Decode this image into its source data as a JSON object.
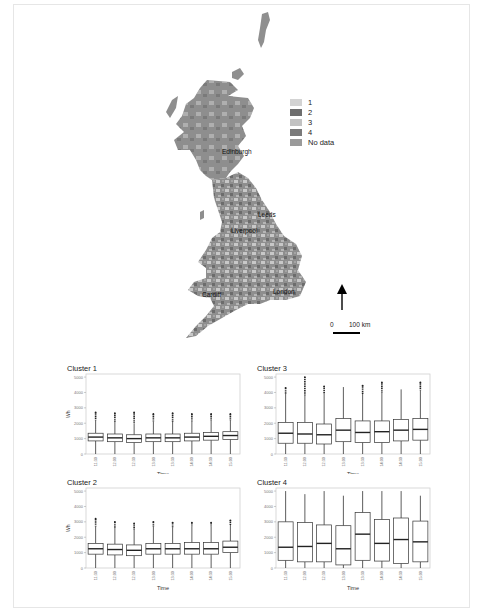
{
  "map": {
    "legend": {
      "items": [
        {
          "label": "1",
          "color": "#d3d3d3"
        },
        {
          "label": "2",
          "color": "#6e6e6e"
        },
        {
          "label": "3",
          "color": "#c2c2c2"
        },
        {
          "label": "4",
          "color": "#7a7a7a"
        },
        {
          "label": "No data",
          "color": "#9a9a9a"
        }
      ]
    },
    "cities": [
      {
        "name": "Edinburgh",
        "x": 222,
        "y": 148
      },
      {
        "name": "Leeds",
        "x": 258,
        "y": 211
      },
      {
        "name": "Liverpool",
        "x": 231,
        "y": 227
      },
      {
        "name": "Cardiff",
        "x": 202,
        "y": 291
      },
      {
        "name": "London",
        "x": 273,
        "y": 288
      }
    ],
    "scale_bar": {
      "zero": "0",
      "distance": "100 km"
    },
    "north_arrow": "north-arrow"
  },
  "chart_data": [
    {
      "type": "box",
      "title": "Cluster 1",
      "xlabel": "Time",
      "ylabel": "Wh",
      "categories": [
        "11:30",
        "12:00",
        "12:30",
        "13:00",
        "13:30",
        "14:00",
        "14:30",
        "15:00"
      ],
      "yticks": [
        0,
        1000,
        2000,
        3000,
        4000,
        5000
      ],
      "ylim": [
        0,
        5200
      ],
      "boxes": [
        {
          "min": 0,
          "q1": 850,
          "median": 1100,
          "q3": 1350,
          "max": 2200,
          "outlier_max": 2700
        },
        {
          "min": 0,
          "q1": 800,
          "median": 1050,
          "q3": 1300,
          "max": 2100,
          "outlier_max": 2650
        },
        {
          "min": 0,
          "q1": 750,
          "median": 1000,
          "q3": 1250,
          "max": 2000,
          "outlier_max": 2700
        },
        {
          "min": 0,
          "q1": 800,
          "median": 1050,
          "q3": 1300,
          "max": 2100,
          "outlier_max": 2600
        },
        {
          "min": 0,
          "q1": 800,
          "median": 1050,
          "q3": 1300,
          "max": 2100,
          "outlier_max": 2650
        },
        {
          "min": 0,
          "q1": 850,
          "median": 1100,
          "q3": 1350,
          "max": 2100,
          "outlier_max": 2600
        },
        {
          "min": 0,
          "q1": 900,
          "median": 1150,
          "q3": 1400,
          "max": 2200,
          "outlier_max": 2600
        },
        {
          "min": 0,
          "q1": 950,
          "median": 1200,
          "q3": 1450,
          "max": 2200,
          "outlier_max": 2600
        }
      ]
    },
    {
      "type": "box",
      "title": "Cluster 3",
      "xlabel": "Time",
      "ylabel": "",
      "categories": [
        "11:30",
        "12:00",
        "12:30",
        "13:00",
        "13:30",
        "14:00",
        "14:30",
        "15:00"
      ],
      "yticks": [
        0,
        1000,
        2000,
        3000,
        4000,
        5000
      ],
      "ylim": [
        0,
        5200
      ],
      "boxes": [
        {
          "min": 0,
          "q1": 700,
          "median": 1350,
          "q3": 2050,
          "max": 3900,
          "outlier_max": 4300
        },
        {
          "min": 0,
          "q1": 700,
          "median": 1300,
          "q3": 2050,
          "max": 3800,
          "outlier_max": 5000
        },
        {
          "min": 0,
          "q1": 650,
          "median": 1250,
          "q3": 1950,
          "max": 3900,
          "outlier_max": 4400
        },
        {
          "min": 0,
          "q1": 800,
          "median": 1550,
          "q3": 2300,
          "max": 4350,
          "outlier_max": null
        },
        {
          "min": 0,
          "q1": 750,
          "median": 1400,
          "q3": 2150,
          "max": 3900,
          "outlier_max": 4450
        },
        {
          "min": 0,
          "q1": 750,
          "median": 1450,
          "q3": 2150,
          "max": 4000,
          "outlier_max": 4650
        },
        {
          "min": 0,
          "q1": 850,
          "median": 1550,
          "q3": 2250,
          "max": 4200,
          "outlier_max": null
        },
        {
          "min": 0,
          "q1": 900,
          "median": 1600,
          "q3": 2300,
          "max": 4150,
          "outlier_max": 4650
        }
      ]
    },
    {
      "type": "box",
      "title": "Cluster 2",
      "xlabel": "Time",
      "ylabel": "Wh",
      "categories": [
        "11:30",
        "12:00",
        "12:30",
        "13:00",
        "13:30",
        "14:00",
        "14:30",
        "15:00"
      ],
      "yticks": [
        0,
        1000,
        2000,
        3000,
        4000,
        5000
      ],
      "ylim": [
        0,
        5200
      ],
      "boxes": [
        {
          "min": 0,
          "q1": 900,
          "median": 1250,
          "q3": 1600,
          "max": 2700,
          "outlier_max": 3200
        },
        {
          "min": 0,
          "q1": 850,
          "median": 1200,
          "q3": 1550,
          "max": 2600,
          "outlier_max": 3000
        },
        {
          "min": 0,
          "q1": 800,
          "median": 1150,
          "q3": 1500,
          "max": 2500,
          "outlier_max": 2900
        },
        {
          "min": 0,
          "q1": 900,
          "median": 1250,
          "q3": 1600,
          "max": 2700,
          "outlier_max": 3000
        },
        {
          "min": 0,
          "q1": 900,
          "median": 1250,
          "q3": 1600,
          "max": 2650,
          "outlier_max": 2950
        },
        {
          "min": 0,
          "q1": 900,
          "median": 1250,
          "q3": 1650,
          "max": 2700,
          "outlier_max": 2950
        },
        {
          "min": 0,
          "q1": 900,
          "median": 1250,
          "q3": 1650,
          "max": 2700,
          "outlier_max": 2950
        },
        {
          "min": 0,
          "q1": 1000,
          "median": 1350,
          "q3": 1750,
          "max": 2800,
          "outlier_max": 3100
        }
      ]
    },
    {
      "type": "box",
      "title": "Cluster 4",
      "xlabel": "Time",
      "ylabel": "",
      "categories": [
        "11:30",
        "12:00",
        "12:30",
        "13:00",
        "13:30",
        "14:00",
        "14:30",
        "15:00"
      ],
      "yticks": [
        0,
        1000,
        2000,
        3000,
        4000,
        5000
      ],
      "ylim": [
        0,
        5200
      ],
      "boxes": [
        {
          "min": 0,
          "q1": 500,
          "median": 1350,
          "q3": 3000,
          "max": 5000,
          "outlier_max": null
        },
        {
          "min": 0,
          "q1": 400,
          "median": 1400,
          "q3": 2950,
          "max": 4800,
          "outlier_max": null
        },
        {
          "min": 0,
          "q1": 400,
          "median": 1600,
          "q3": 2800,
          "max": 5000,
          "outlier_max": null
        },
        {
          "min": 0,
          "q1": 200,
          "median": 1250,
          "q3": 2750,
          "max": 4700,
          "outlier_max": null
        },
        {
          "min": 0,
          "q1": 500,
          "median": 2200,
          "q3": 3600,
          "max": 5000,
          "outlier_max": null
        },
        {
          "min": 0,
          "q1": 450,
          "median": 1600,
          "q3": 3150,
          "max": 5000,
          "outlier_max": null
        },
        {
          "min": 0,
          "q1": 300,
          "median": 1850,
          "q3": 3250,
          "max": 5000,
          "outlier_max": null
        },
        {
          "min": 0,
          "q1": 400,
          "median": 1700,
          "q3": 3050,
          "max": 4700,
          "outlier_max": null
        }
      ]
    }
  ]
}
